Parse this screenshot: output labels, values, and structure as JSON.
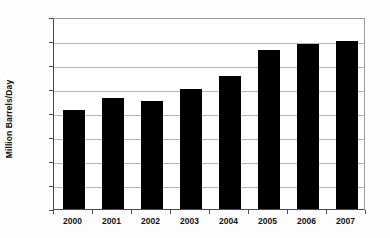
{
  "chart_data": {
    "type": "bar",
    "title": "",
    "subtitle": "",
    "xlabel": "",
    "ylabel": "Million Barrels/Day",
    "categories": [
      "2000",
      "2001",
      "2002",
      "2003",
      "2004",
      "2005",
      "2006",
      "2007"
    ],
    "values": [
      2.07,
      2.32,
      2.26,
      2.51,
      2.78,
      3.32,
      3.43,
      3.5
    ],
    "series": [
      {
        "name": "Production",
        "values": [
          2.07,
          2.32,
          2.26,
          2.51,
          2.78,
          3.32,
          3.43,
          3.5
        ]
      }
    ],
    "ylim": [
      0.0,
      4.0
    ],
    "ytick_step": 0.5,
    "ytick_labels": [
      "0.0",
      "0.5",
      "1.0",
      "1.5",
      "2.0",
      "2.5",
      "3.0",
      "3.5",
      "4.0"
    ],
    "ytick_values": [
      0.0,
      0.5,
      1.0,
      1.5,
      2.0,
      2.5,
      3.0,
      3.5,
      4.0
    ],
    "grid": true,
    "grid_axis": "y",
    "legend": false,
    "legend_position": "none",
    "bar_color": "#000000",
    "gridline_color": "#b4b4b4",
    "axis_color": "#4a4a4a",
    "plot_background": "#ffffff",
    "figure_background": "#fdfdfd"
  }
}
